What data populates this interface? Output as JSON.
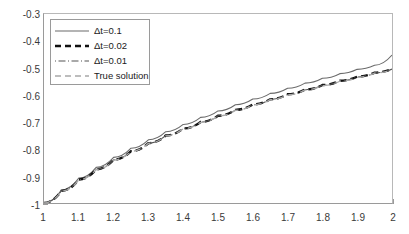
{
  "chart_data": {
    "type": "line",
    "title": "",
    "xlabel": "",
    "ylabel": "",
    "xlim": [
      1,
      2
    ],
    "ylim": [
      -1,
      -0.3
    ],
    "grid": false,
    "legend_position": "top-left",
    "xticks": [
      "1",
      "1.1",
      "1.2",
      "1.3",
      "1.4",
      "1.5",
      "1.6",
      "1.7",
      "1.8",
      "1.9",
      "2"
    ],
    "xtick_values": [
      1,
      1.1,
      1.2,
      1.3,
      1.4,
      1.5,
      1.6,
      1.7,
      1.8,
      1.9,
      2
    ],
    "yticks": [
      "-0.3",
      "-0.4",
      "-0.5",
      "-0.6",
      "-0.7",
      "-0.8",
      "-0.9",
      "-1"
    ],
    "ytick_values": [
      -0.3,
      -0.4,
      -0.5,
      -0.6,
      -0.7,
      -0.8,
      -0.9,
      -1
    ],
    "x": [
      1,
      1.05,
      1.1,
      1.15,
      1.2,
      1.25,
      1.3,
      1.35,
      1.4,
      1.45,
      1.5,
      1.55,
      1.6,
      1.65,
      1.7,
      1.75,
      1.8,
      1.85,
      1.9,
      1.95,
      2
    ],
    "series": [
      {
        "name": "Δt=0.1",
        "style": "solid",
        "color": "#6b6b6b",
        "width": 1.1,
        "values": [
          -1,
          -0.952,
          -0.908,
          -0.868,
          -0.831,
          -0.797,
          -0.766,
          -0.736,
          -0.709,
          -0.683,
          -0.659,
          -0.636,
          -0.615,
          -0.594,
          -0.575,
          -0.556,
          -0.538,
          -0.521,
          -0.505,
          -0.49,
          -0.452
        ]
      },
      {
        "name": "Δt=0.02",
        "style": "dashed",
        "color": "#111111",
        "width": 2.4,
        "values": [
          -1,
          -0.955,
          -0.913,
          -0.875,
          -0.84,
          -0.808,
          -0.778,
          -0.75,
          -0.724,
          -0.7,
          -0.677,
          -0.655,
          -0.635,
          -0.616,
          -0.597,
          -0.58,
          -0.563,
          -0.547,
          -0.532,
          -0.517,
          -0.503
        ]
      },
      {
        "name": "Δt=0.01",
        "style": "dashdot",
        "color": "#555555",
        "width": 1.1,
        "values": [
          -1,
          -0.955,
          -0.913,
          -0.875,
          -0.84,
          -0.808,
          -0.778,
          -0.75,
          -0.724,
          -0.7,
          -0.677,
          -0.656,
          -0.636,
          -0.616,
          -0.598,
          -0.58,
          -0.564,
          -0.548,
          -0.533,
          -0.518,
          -0.504
        ]
      },
      {
        "name": "True solution",
        "style": "dashed-light",
        "color": "#a8a8a8",
        "width": 1.3,
        "values": [
          -1,
          -0.956,
          -0.914,
          -0.876,
          -0.841,
          -0.809,
          -0.779,
          -0.751,
          -0.725,
          -0.701,
          -0.678,
          -0.657,
          -0.637,
          -0.617,
          -0.599,
          -0.581,
          -0.565,
          -0.549,
          -0.534,
          -0.519,
          -0.505
        ]
      }
    ]
  },
  "legend": {
    "items": [
      {
        "label": "Δt=0.1"
      },
      {
        "label": "Δt=0.02"
      },
      {
        "label": "Δt=0.01"
      },
      {
        "label": "True solution"
      }
    ]
  },
  "axes": {
    "line_color": "#9a9a9a"
  }
}
